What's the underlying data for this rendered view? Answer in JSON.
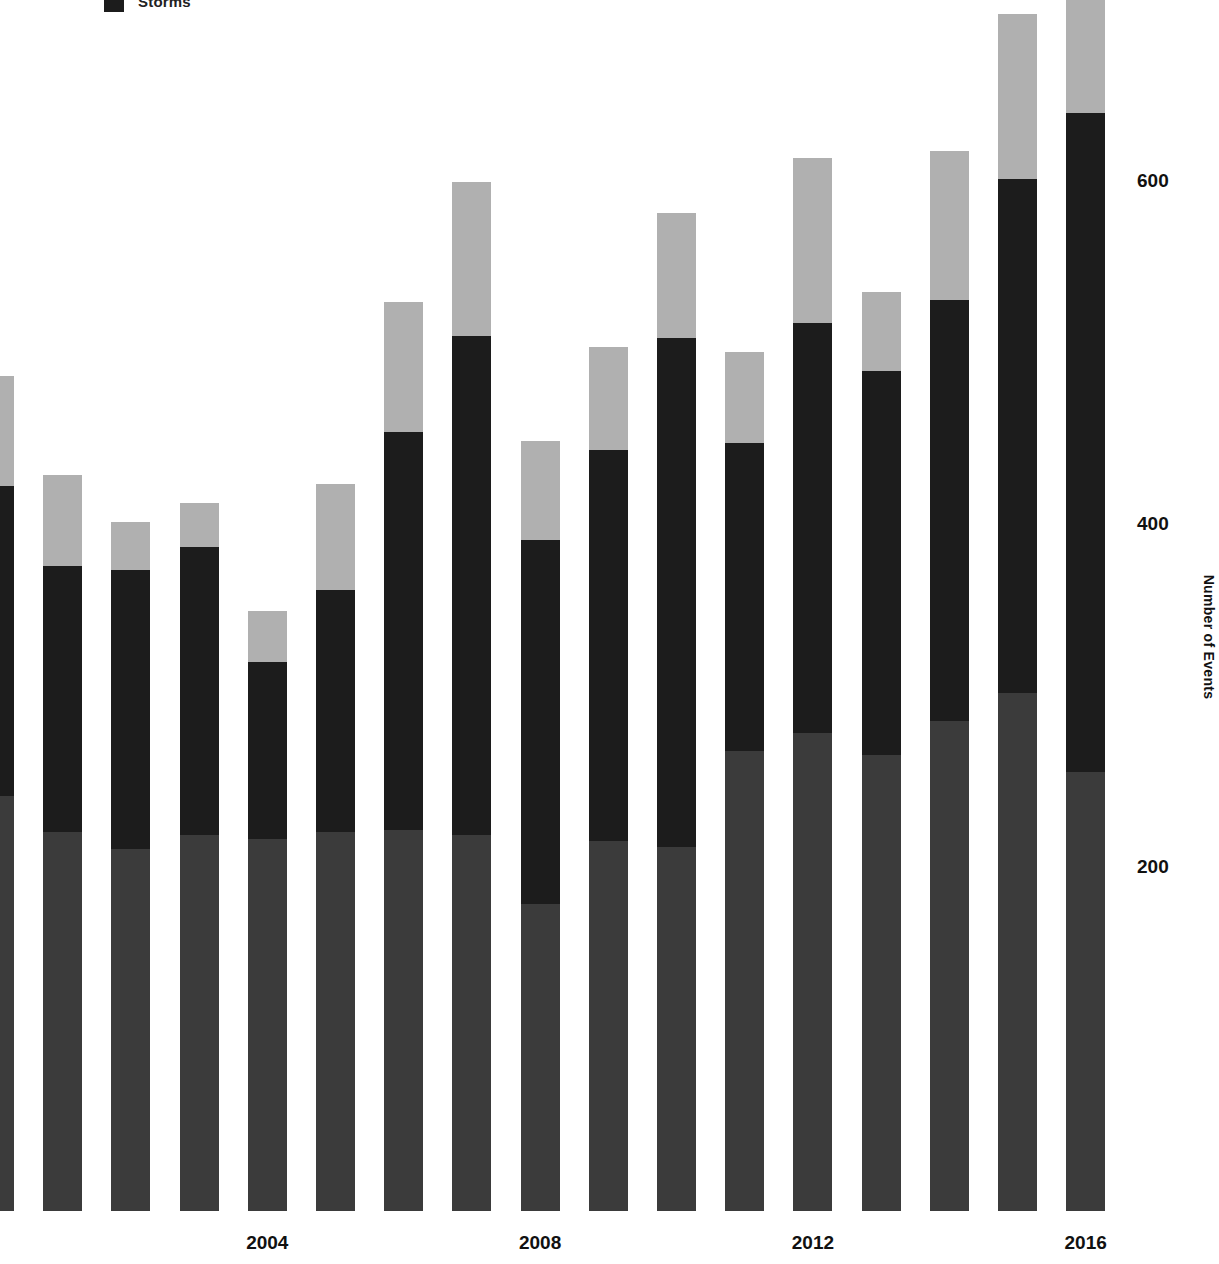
{
  "legend": {
    "items": [
      {
        "label": "Storms",
        "color": "#1c1c1c",
        "swatch_name": "storms-swatch"
      }
    ]
  },
  "axes": {
    "y_title": "Number of Events",
    "y_ticks": [
      {
        "label": "600",
        "value": 600
      },
      {
        "label": "400",
        "value": 400
      },
      {
        "label": "200",
        "value": 200
      }
    ],
    "x_ticks": [
      {
        "label": "2004",
        "value": 2004
      },
      {
        "label": "2008",
        "value": 2008
      },
      {
        "label": "2012",
        "value": 2012
      },
      {
        "label": "2016",
        "value": 2016
      }
    ]
  },
  "colors": {
    "background": "#ffffff",
    "bottom_segment": "#3b3b3b",
    "middle_segment": "#1c1c1c",
    "top_segment": "#b0b0b0",
    "text": "#111111"
  },
  "chart_data": {
    "type": "bar",
    "subtype": "stacked-vertical",
    "title": "",
    "xlabel": "",
    "ylabel": "Number of Events",
    "ylim": [
      0,
      730
    ],
    "xlim": [
      1999.5,
      2016.5
    ],
    "grid": false,
    "legend_position": "top-left",
    "categories": [
      2000,
      2001,
      2002,
      2003,
      2004,
      2005,
      2006,
      2007,
      2008,
      2009,
      2010,
      2011,
      2012,
      2013,
      2014,
      2015,
      2016
    ],
    "series": [
      {
        "name": "Bottom",
        "color": "#3b3b3b",
        "values": [
          242,
          221,
          211,
          219,
          217,
          221,
          222,
          219,
          179,
          216,
          212,
          268,
          279,
          266,
          286,
          302,
          256
        ]
      },
      {
        "name": "Storms",
        "color": "#1c1c1c",
        "values": [
          181,
          155,
          163,
          168,
          103,
          141,
          232,
          291,
          212,
          228,
          297,
          180,
          239,
          224,
          245,
          300,
          384
        ]
      },
      {
        "name": "Top",
        "color": "#b0b0b0",
        "values": [
          64,
          53,
          28,
          26,
          30,
          62,
          76,
          90,
          58,
          60,
          73,
          53,
          96,
          46,
          87,
          96,
          72
        ]
      }
    ],
    "totals": [
      487,
      429,
      402,
      413,
      350,
      424,
      530,
      600,
      449,
      504,
      582,
      501,
      614,
      536,
      618,
      698,
      712
    ]
  },
  "geometry": {
    "bar_width_px": 39,
    "bar_pitch_px": 68.2,
    "first_bar_left_px": -25,
    "baseline_y_px": 1211,
    "plot_bottom_px": 1202,
    "px_per_unit": 1.715
  }
}
